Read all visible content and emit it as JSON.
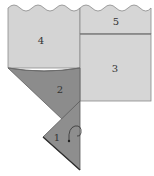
{
  "diagram": {
    "title": "",
    "colors": {
      "light_panel": "#d4d4d4",
      "dark_panel": "#8c8c8c",
      "edge": "#6a6a6a",
      "label": "#333333",
      "background": "#ffffff"
    },
    "panels": [
      {
        "id": "4",
        "label": "4",
        "shade": "light"
      },
      {
        "id": "5",
        "label": "5",
        "shade": "light"
      },
      {
        "id": "3",
        "label": "3",
        "shade": "light"
      },
      {
        "id": "2",
        "label": "2",
        "shade": "dark"
      },
      {
        "id": "1",
        "label": "1",
        "shade": "dark"
      }
    ],
    "annotations": [
      {
        "type": "curved-arrow",
        "location": "panel-1",
        "meaning": "fold direction"
      }
    ]
  }
}
